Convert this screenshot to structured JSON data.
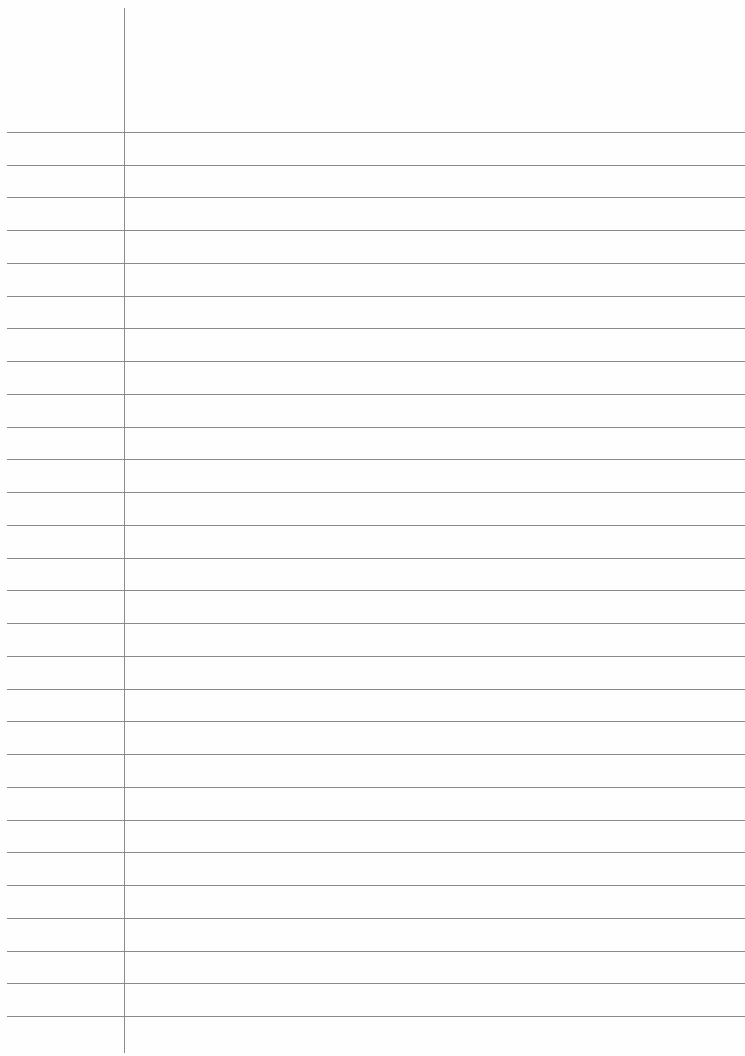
{
  "page": {
    "type": "lined-notebook-paper",
    "background_color": "#fefefe",
    "line_color": "#8a8a8a",
    "margin_line_color": "#8c8c8c",
    "margin_x": 124,
    "first_line_y": 132,
    "line_spacing": 32.74,
    "line_count": 28,
    "text": []
  }
}
